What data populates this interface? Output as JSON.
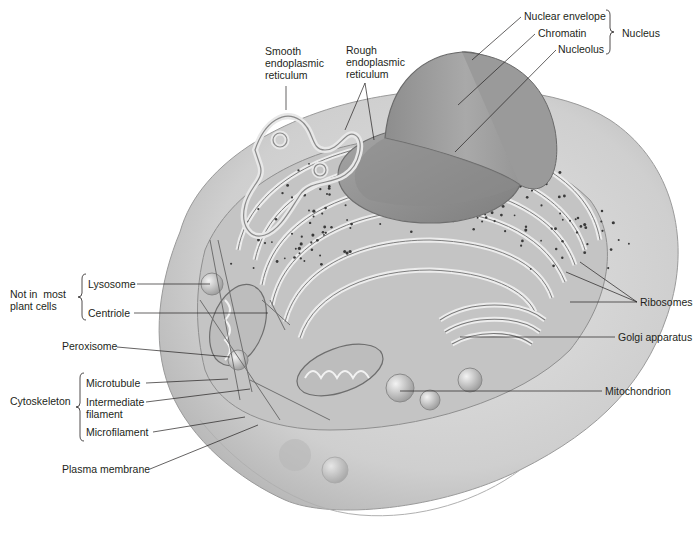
{
  "diagram": {
    "colors": {
      "cell_fill": "#d9d9d9",
      "cell_shadow": "#bdbdbd",
      "cytoplasm": "#c8c8c8",
      "er_fill": "#e6e6e6",
      "er_stroke": "#8c8c8c",
      "nucleus_fill": "#9e9e9e",
      "nucleus_cut": "#b5b5b5",
      "ribosome": "#3a3a3a",
      "leader_line": "#231f20",
      "text": "#231f20"
    },
    "labels": [
      {
        "id": "nuclear-envelope",
        "text": "Nuclear envelope",
        "x": 524,
        "y": 10
      },
      {
        "id": "chromatin",
        "text": "Chromatin",
        "x": 538,
        "y": 27
      },
      {
        "id": "nucleolus",
        "text": "Nucleolus",
        "x": 558,
        "y": 43
      },
      {
        "id": "nucleus",
        "text": "Nucleus",
        "x": 622,
        "y": 27
      },
      {
        "id": "smooth-er",
        "text": "Smooth\nendoplasmic\nreticulum",
        "x": 265,
        "y": 45
      },
      {
        "id": "rough-er",
        "text": "Rough\nendoplasmic\nreticulum",
        "x": 346,
        "y": 44
      },
      {
        "id": "not-in-most-plant-cells",
        "text": "Not in  most\nplant cells",
        "x": 10,
        "y": 288
      },
      {
        "id": "lysosome",
        "text": "Lysosome",
        "x": 88,
        "y": 278
      },
      {
        "id": "centriole",
        "text": "Centriole",
        "x": 88,
        "y": 307
      },
      {
        "id": "peroxisome",
        "text": "Peroxisome",
        "x": 62,
        "y": 340
      },
      {
        "id": "cytoskeleton",
        "text": "Cytoskeleton",
        "x": 10,
        "y": 395
      },
      {
        "id": "microtubule",
        "text": "Microtubule",
        "x": 86,
        "y": 377
      },
      {
        "id": "intermediate-filament",
        "text": "Intermediate\nfilament",
        "x": 86,
        "y": 396
      },
      {
        "id": "microfilament",
        "text": "Microfilament",
        "x": 86,
        "y": 426
      },
      {
        "id": "plasma-membrane",
        "text": "Plasma membrane",
        "x": 62,
        "y": 463
      },
      {
        "id": "ribosomes",
        "text": "Ribosomes",
        "x": 640,
        "y": 296
      },
      {
        "id": "golgi-apparatus",
        "text": "Golgi apparatus",
        "x": 618,
        "y": 331
      },
      {
        "id": "mitochondrion",
        "text": "Mitochondrion",
        "x": 605,
        "y": 385
      }
    ],
    "leaders": [
      {
        "for": "nuclear-envelope",
        "x1": 521,
        "y1": 17,
        "x2": 472,
        "y2": 60
      },
      {
        "for": "chromatin",
        "x1": 535,
        "y1": 34,
        "x2": 458,
        "y2": 105
      },
      {
        "for": "nucleolus",
        "x1": 556,
        "y1": 50,
        "x2": 455,
        "y2": 152
      },
      {
        "for": "smooth-er",
        "x1": 286,
        "y1": 86,
        "x2": 286,
        "y2": 110
      },
      {
        "for": "rough-er",
        "x1": 365,
        "y1": 83,
        "x2": 345,
        "y2": 130
      },
      {
        "for": "rough-er",
        "x1": 365,
        "y1": 83,
        "x2": 374,
        "y2": 140
      },
      {
        "for": "lysosome",
        "x1": 137,
        "y1": 284,
        "x2": 210,
        "y2": 284
      },
      {
        "for": "centriole",
        "x1": 134,
        "y1": 313,
        "x2": 268,
        "y2": 313
      },
      {
        "for": "peroxisome",
        "x1": 117,
        "y1": 347,
        "x2": 230,
        "y2": 357
      },
      {
        "for": "microtubule",
        "x1": 146,
        "y1": 383,
        "x2": 228,
        "y2": 379
      },
      {
        "for": "intermediate-filament",
        "x1": 146,
        "y1": 402,
        "x2": 250,
        "y2": 389
      },
      {
        "for": "microfilament",
        "x1": 153,
        "y1": 432,
        "x2": 245,
        "y2": 417
      },
      {
        "for": "plasma-membrane",
        "x1": 150,
        "y1": 469,
        "x2": 258,
        "y2": 425
      },
      {
        "for": "ribosomes",
        "x1": 637,
        "y1": 302,
        "x2": 580,
        "y2": 262
      },
      {
        "for": "ribosomes",
        "x1": 637,
        "y1": 302,
        "x2": 566,
        "y2": 272
      },
      {
        "for": "ribosomes",
        "x1": 637,
        "y1": 302,
        "x2": 570,
        "y2": 302
      },
      {
        "for": "golgi-apparatus",
        "x1": 615,
        "y1": 337,
        "x2": 460,
        "y2": 337
      },
      {
        "for": "mitochondrion",
        "x1": 602,
        "y1": 391,
        "x2": 400,
        "y2": 391
      }
    ],
    "brackets": [
      {
        "for": "nucleus",
        "side": "right",
        "x": 610,
        "y1": 10,
        "y2": 54
      },
      {
        "for": "not-in-most-plant-cells",
        "side": "left",
        "x": 82,
        "y1": 274,
        "y2": 320
      },
      {
        "for": "cytoskeleton",
        "side": "left",
        "x": 80,
        "y1": 373,
        "y2": 441
      }
    ]
  }
}
